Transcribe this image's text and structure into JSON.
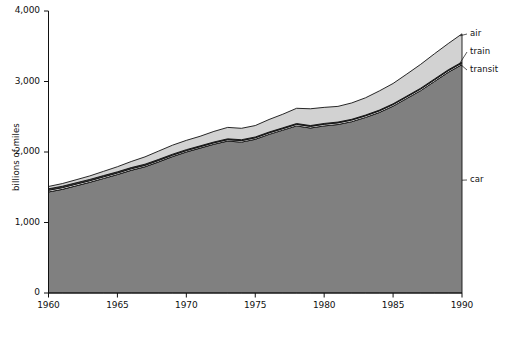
{
  "chart_data": {
    "type": "area",
    "subtype": "stacked-area",
    "title": "",
    "xlabel": "",
    "ylabel": "billions of miles",
    "xlim": [
      1960,
      1990
    ],
    "ylim": [
      0,
      4000
    ],
    "grid": false,
    "legend_position": "right-inline-labels",
    "x_ticks": [
      "1960",
      "1965",
      "1970",
      "1975",
      "1980",
      "1985",
      "1990"
    ],
    "y_ticks": [
      "0",
      "1,000",
      "2,000",
      "3,000",
      "4,000"
    ],
    "x": [
      1960,
      1961,
      1962,
      1963,
      1964,
      1965,
      1966,
      1967,
      1968,
      1969,
      1970,
      1971,
      1972,
      1973,
      1974,
      1975,
      1976,
      1977,
      1978,
      1979,
      1980,
      1981,
      1982,
      1983,
      1984,
      1985,
      1986,
      1987,
      1988,
      1989,
      1990
    ],
    "series": [
      {
        "name": "car",
        "color": "#808080",
        "values": [
          1433,
          1470,
          1520,
          1570,
          1625,
          1680,
          1740,
          1790,
          1860,
          1935,
          2000,
          2055,
          2110,
          2155,
          2140,
          2180,
          2250,
          2310,
          2370,
          2340,
          2370,
          2390,
          2430,
          2490,
          2560,
          2650,
          2760,
          2870,
          3000,
          3130,
          3240
        ]
      },
      {
        "name": "transit",
        "color": "#ffffff",
        "values": [
          24,
          24,
          24,
          23,
          23,
          22,
          22,
          21,
          21,
          20,
          20,
          20,
          20,
          20,
          21,
          21,
          21,
          21,
          22,
          23,
          23,
          23,
          23,
          23,
          23,
          23,
          23,
          23,
          23,
          23,
          23
        ]
      },
      {
        "name": "train",
        "color": "#565656",
        "values": [
          21,
          20,
          19,
          18,
          18,
          17,
          17,
          16,
          15,
          14,
          13,
          12,
          12,
          12,
          13,
          12,
          12,
          12,
          12,
          12,
          12,
          12,
          11,
          11,
          11,
          11,
          11,
          12,
          12,
          13,
          13
        ]
      },
      {
        "name": "air",
        "color": "#d2d2d2",
        "values": [
          33,
          38,
          43,
          50,
          60,
          72,
          86,
          104,
          118,
          128,
          132,
          136,
          150,
          162,
          162,
          162,
          178,
          193,
          216,
          238,
          228,
          222,
          232,
          245,
          272,
          288,
          312,
          338,
          358,
          372,
          400
        ]
      }
    ],
    "series_label_callouts": [
      {
        "label": "air",
        "y_value": 3550
      },
      {
        "label": "train",
        "y_value": 3340
      },
      {
        "label": "transit",
        "y_value": 3180
      },
      {
        "label": "car",
        "y_value": 1600
      }
    ]
  }
}
